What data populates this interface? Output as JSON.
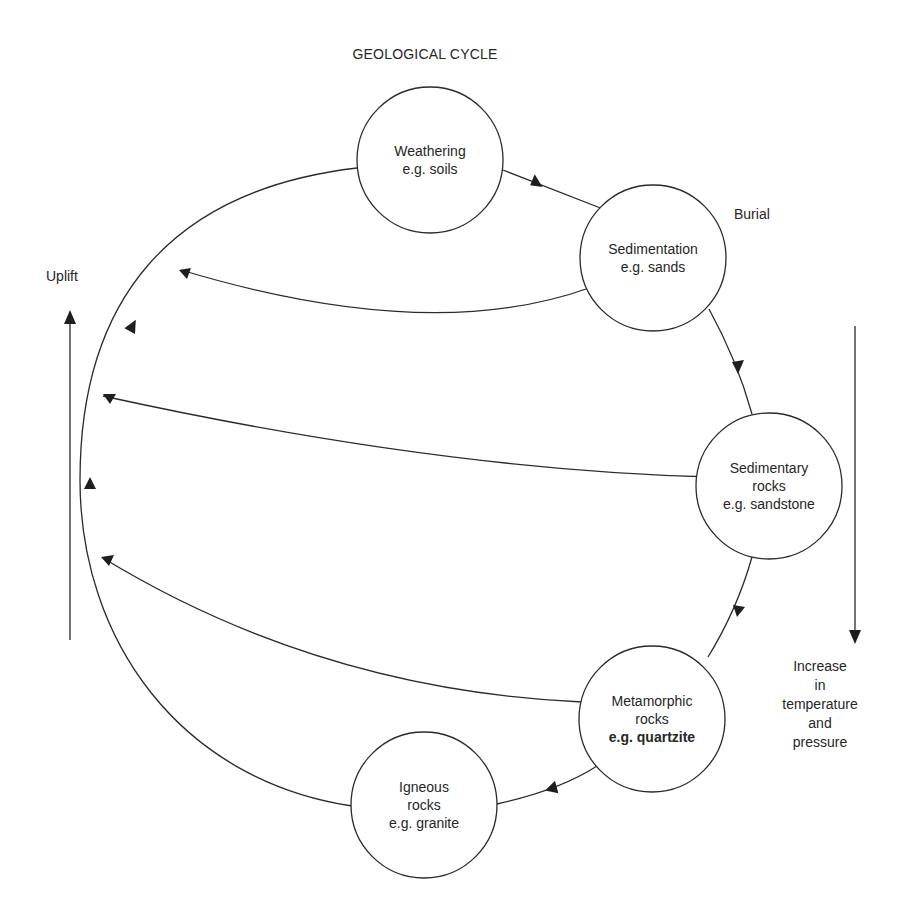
{
  "title": "GEOLOGICAL CYCLE",
  "colors": {
    "background": "#ffffff",
    "stroke": "#2a2a2a",
    "text": "#262626"
  },
  "nodes": [
    {
      "id": "weathering",
      "lines": [
        "Weathering",
        "e.g. soils"
      ],
      "bold_last": false
    },
    {
      "id": "sedimentation",
      "lines": [
        "Sedimentation",
        "e.g. sands"
      ],
      "bold_last": false
    },
    {
      "id": "sedimentary_rocks",
      "lines": [
        "Sedimentary",
        "rocks",
        "e.g. sandstone"
      ],
      "bold_last": false
    },
    {
      "id": "metamorphic_rocks",
      "lines": [
        "Metamorphic",
        "rocks",
        "e.g. quartzite"
      ],
      "bold_last": true
    },
    {
      "id": "igneous_rocks",
      "lines": [
        "Igneous",
        "rocks",
        "e.g. granite"
      ],
      "bold_last": false
    }
  ],
  "side_labels": {
    "burial": "Burial",
    "uplift": "Uplift",
    "increase": [
      "Increase",
      "in",
      "temperature",
      "and",
      "pressure"
    ]
  }
}
